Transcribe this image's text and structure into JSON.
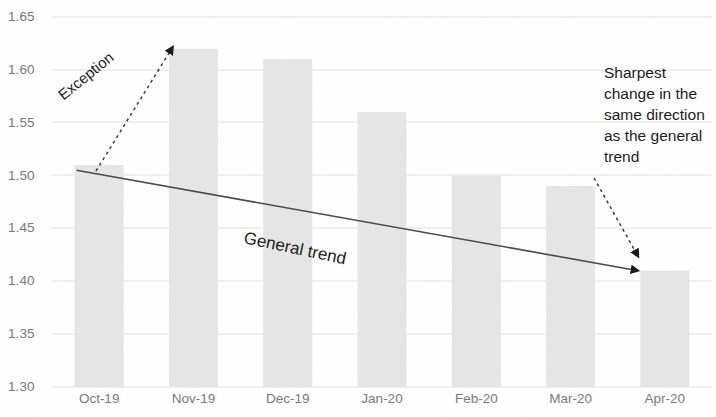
{
  "chart_data": {
    "type": "bar",
    "title": "",
    "subtitle": "",
    "xlabel": "",
    "ylabel": "",
    "categories": [
      "Oct-19",
      "Nov-19",
      "Dec-19",
      "Jan-20",
      "Feb-20",
      "Mar-20",
      "Apr-20"
    ],
    "values": [
      1.51,
      1.62,
      1.61,
      1.56,
      1.5,
      1.49,
      1.41
    ],
    "ylim": [
      1.3,
      1.65
    ],
    "yticks": [
      "1.65",
      "1.60",
      "1.55",
      "1.50",
      "1.45",
      "1.40",
      "1.35",
      "1.30"
    ],
    "ytick_values": [
      1.65,
      1.6,
      1.55,
      1.5,
      1.45,
      1.4,
      1.35,
      1.3
    ],
    "grid": true,
    "legend": false,
    "legend_position": "none",
    "bar_color": "#e6e6e6",
    "gridline_color": "#e0e0e0",
    "tick_label_color": "#7a7a7a",
    "annotation_color": "#1d1d1d",
    "series": [
      {
        "name": "Rate",
        "values": [
          1.51,
          1.62,
          1.61,
          1.56,
          1.5,
          1.49,
          1.41
        ]
      }
    ],
    "trendline": {
      "name": "General trend",
      "start": {
        "category": "Oct-19",
        "value": 1.505
      },
      "end": {
        "category": "Apr-20",
        "value": 1.41
      },
      "direction": "decreasing",
      "color": "#4a4a4a"
    },
    "annotations": [
      {
        "name": "exception",
        "text": "Exception",
        "points_to": "Nov-19",
        "points_to_value": 1.62,
        "arrow_style": "dotted",
        "rotation_deg": -39
      },
      {
        "name": "general-trend",
        "text": "General trend",
        "points_to": "trendline",
        "arrow_style": "solid",
        "rotation_deg": 12
      },
      {
        "name": "sharpest-change",
        "text": "Sharpest change in the same direction as the general trend",
        "points_to": "Apr-20",
        "points_to_value": 1.41,
        "arrow_style": "dotted",
        "rotation_deg": 0
      }
    ]
  },
  "annotations": {
    "exception_label": "Exception",
    "general_trend_label": "General trend",
    "sharpest_label": "Sharpest change in the same direction as the general trend"
  }
}
